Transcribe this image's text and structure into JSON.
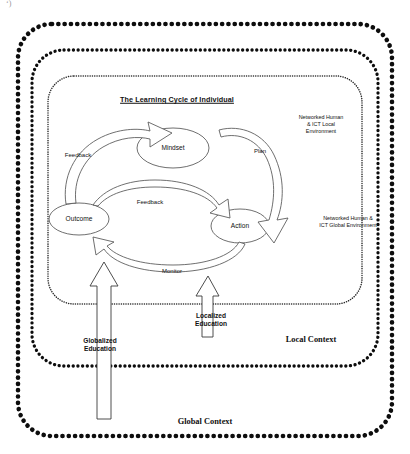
{
  "diagram": {
    "title": "The Learning Cycle of Individual",
    "corner_artifact": "‘)",
    "containers": [
      {
        "id": "global",
        "label": "Global Context",
        "border_style": "dotted-thick"
      },
      {
        "id": "local",
        "label": "Local Context",
        "border_style": "dotted-medium"
      },
      {
        "id": "cycle",
        "label": "The Learning Cycle of Individual",
        "border_style": "dotted-fine"
      }
    ],
    "nodes": [
      {
        "id": "mindset",
        "label": "Mindset"
      },
      {
        "id": "action",
        "label": "Action"
      },
      {
        "id": "outcome",
        "label": "Outcome"
      }
    ],
    "arrows": [
      {
        "id": "plan",
        "label": "Plan",
        "from": "mindset",
        "to": "action"
      },
      {
        "id": "monitor",
        "label": "Monitor",
        "from": "action",
        "to": "outcome"
      },
      {
        "id": "feedback-outer",
        "label": "Feedback",
        "from": "outcome",
        "to": "mindset"
      },
      {
        "id": "feedback-inner",
        "label": "Feedback",
        "from": "outcome",
        "to": "action"
      }
    ],
    "environment_labels": [
      {
        "id": "local-env",
        "label": "Networked Human\n& ICT Local\nEnvironment"
      },
      {
        "id": "global-env",
        "label": "Networked Human &\nICT Global Environment"
      }
    ],
    "inputs": [
      {
        "id": "globalized-education",
        "label": "Globalized\nEducation",
        "direction": "up"
      },
      {
        "id": "localized-education",
        "label": "Localized\nEducation",
        "direction": "up"
      }
    ],
    "colors": {
      "ink": "#111111",
      "background": "#ffffff",
      "line": "#444444"
    }
  }
}
